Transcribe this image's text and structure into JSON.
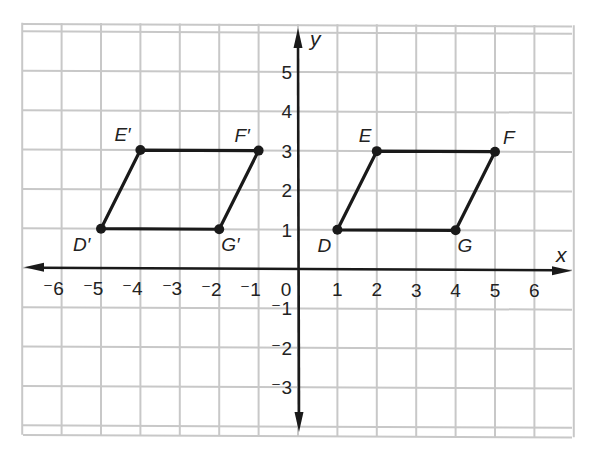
{
  "chart_data": {
    "type": "scatter",
    "title": "",
    "xlabel": "x",
    "ylabel": "y",
    "xlim": [
      -7,
      7
    ],
    "ylim": [
      -4,
      6
    ],
    "grid": true,
    "x_ticks": [
      "-6",
      "-5",
      "-4",
      "-3",
      "-2",
      "-1",
      "0",
      "1",
      "2",
      "3",
      "4",
      "5",
      "6"
    ],
    "y_ticks": [
      "5",
      "4",
      "3",
      "2",
      "1",
      "-1",
      "-2",
      "-3"
    ],
    "origin_label": "0",
    "series": [
      {
        "name": "DEFG",
        "closed": true,
        "points": [
          {
            "label": "D",
            "x": 1,
            "y": 1
          },
          {
            "label": "E",
            "x": 2,
            "y": 3
          },
          {
            "label": "F",
            "x": 5,
            "y": 3
          },
          {
            "label": "G",
            "x": 4,
            "y": 1
          }
        ]
      },
      {
        "name": "D'E'F'G'",
        "closed": true,
        "points": [
          {
            "label": "D′",
            "x": -5,
            "y": 1
          },
          {
            "label": "E′",
            "x": -4,
            "y": 3
          },
          {
            "label": "F′",
            "x": -1,
            "y": 3
          },
          {
            "label": "G′",
            "x": -2,
            "y": 1
          }
        ]
      }
    ],
    "colors": {
      "grid": "#c8c8c8",
      "axis": "#1a1a1a",
      "shape": "#1a1a1a"
    }
  }
}
